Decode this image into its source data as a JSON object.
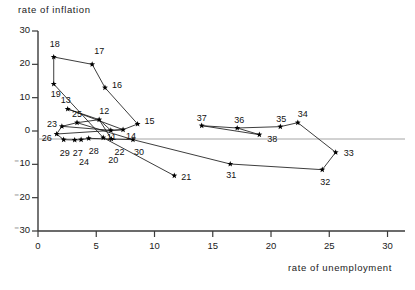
{
  "chart_data": {
    "type": "scatter",
    "title": "",
    "xlabel": "rate of unemployment",
    "ylabel": "rate of inflation",
    "xlim": [
      0,
      31.5
    ],
    "ylim": [
      -30,
      30
    ],
    "xticks": [
      "0",
      "5",
      "10",
      "15",
      "20",
      "25",
      "30"
    ],
    "xtick_values": [
      0,
      5,
      10,
      15,
      20,
      25,
      30
    ],
    "yticks": [
      "30",
      "20",
      "10",
      "0",
      "-10",
      "-20",
      "-30"
    ],
    "ytick_values": [
      30,
      20,
      10,
      0,
      -10,
      -20,
      -30
    ],
    "grid": false,
    "legend": "none",
    "zero_line": true,
    "marker": "star",
    "series": [
      {
        "name": "path-a",
        "connected": true,
        "points": [
          {
            "label": "18",
            "x": 1.35,
            "y": 22.2,
            "lx": -4,
            "ly": -13
          },
          {
            "label": "17",
            "x": 4.65,
            "y": 20.0,
            "lx": 2,
            "ly": -13
          },
          {
            "label": "16",
            "x": 5.75,
            "y": 13.0,
            "lx": 7,
            "ly": -3
          },
          {
            "label": "15",
            "x": 8.55,
            "y": 2.1,
            "lx": 7,
            "ly": -3
          },
          {
            "label": "14",
            "x": 7.3,
            "y": 0.4,
            "lx": 3,
            "ly": 6
          },
          {
            "label": "13",
            "x": 2.55,
            "y": 6.6,
            "lx": -7,
            "ly": -9
          },
          {
            "label": "12",
            "x": 5.25,
            "y": 3.4,
            "lx": 0,
            "ly": -9
          },
          {
            "label": "11",
            "x": 6.25,
            "y": 0.2,
            "lx": -4,
            "ly": 7
          }
        ]
      },
      {
        "name": "path-b",
        "connected": true,
        "points": [
          {
            "label": "19",
            "x": 1.35,
            "y": 14.1,
            "lx": -3,
            "ly": 10
          },
          {
            "label": "20",
            "x": 5.6,
            "y": -2.0,
            "lx": 5,
            "ly": 22
          },
          {
            "label": "21",
            "x": 11.7,
            "y": -13.4,
            "lx": 7,
            "ly": 1
          },
          {
            "label": "22",
            "x": 6.3,
            "y": -2.4,
            "lx": 3,
            "ly": 13
          },
          {
            "label": "23",
            "x": 2.05,
            "y": 1.4,
            "lx": -15,
            "ly": -2
          },
          {
            "label": "24",
            "x": 3.7,
            "y": -2.6,
            "lx": -2,
            "ly": 22
          },
          {
            "label": "25",
            "x": 3.35,
            "y": 2.5,
            "lx": -5,
            "ly": -9
          },
          {
            "label": "26",
            "x": 1.6,
            "y": -0.9,
            "lx": -15,
            "ly": 4
          },
          {
            "label": "27",
            "x": 3.15,
            "y": -2.7,
            "lx": -2,
            "ly": 13
          },
          {
            "label": "28",
            "x": 4.35,
            "y": -2.2,
            "lx": 0,
            "ly": 13
          },
          {
            "label": "29",
            "x": 2.2,
            "y": -2.6,
            "lx": -4,
            "ly": 13
          },
          {
            "label": "30",
            "x": 8.15,
            "y": -2.6,
            "lx": 1,
            "ly": 12
          }
        ]
      },
      {
        "name": "path-c",
        "connected": true,
        "points": [
          {
            "label": "31",
            "x": 16.5,
            "y": -9.9,
            "lx": -4,
            "ly": 11
          },
          {
            "label": "32",
            "x": 24.4,
            "y": -11.6,
            "lx": -2,
            "ly": 12
          },
          {
            "label": "33",
            "x": 25.55,
            "y": -6.4,
            "lx": 8,
            "ly": 1
          },
          {
            "label": "34",
            "x": 22.3,
            "y": 2.5,
            "lx": 0,
            "ly": -9
          },
          {
            "label": "35",
            "x": 20.8,
            "y": 1.3,
            "lx": -4,
            "ly": -8
          },
          {
            "label": "36",
            "x": 17.1,
            "y": 0.9,
            "lx": -3,
            "ly": -8
          },
          {
            "label": "37",
            "x": 14.05,
            "y": 1.6,
            "lx": -5,
            "ly": -8
          },
          {
            "label": "38",
            "x": 19.0,
            "y": -1.1,
            "lx": 8,
            "ly": 4
          }
        ]
      }
    ],
    "connections": [
      [
        "18",
        "17"
      ],
      [
        "17",
        "16"
      ],
      [
        "16",
        "15"
      ],
      [
        "15",
        "14"
      ],
      [
        "14",
        "13"
      ],
      [
        "13",
        "12"
      ],
      [
        "12",
        "11"
      ],
      [
        "11",
        "14"
      ],
      [
        "18",
        "19"
      ],
      [
        "19",
        "20"
      ],
      [
        "20",
        "21"
      ],
      [
        "23",
        "25"
      ],
      [
        "25",
        "12"
      ],
      [
        "23",
        "26"
      ],
      [
        "26",
        "29"
      ],
      [
        "29",
        "27"
      ],
      [
        "27",
        "24"
      ],
      [
        "24",
        "28"
      ],
      [
        "28",
        "22"
      ],
      [
        "22",
        "30"
      ],
      [
        "30",
        "31"
      ],
      [
        "31",
        "32"
      ],
      [
        "32",
        "33"
      ],
      [
        "33",
        "34"
      ],
      [
        "34",
        "35"
      ],
      [
        "35",
        "36"
      ],
      [
        "36",
        "37"
      ],
      [
        "37",
        "38"
      ],
      [
        "38",
        "36"
      ],
      [
        "23",
        "11"
      ],
      [
        "26",
        "14"
      ],
      [
        "25",
        "30"
      ],
      [
        "12",
        "22"
      ]
    ]
  },
  "axes": {
    "y_title": "rate of inflation",
    "x_title": "rate of unemployment"
  }
}
